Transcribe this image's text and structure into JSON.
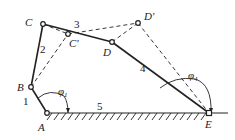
{
  "diagram": {
    "type": "five-bar linkage",
    "points": {
      "A": {
        "label": "A",
        "x": 47,
        "y": 113
      },
      "B": {
        "label": "B",
        "x": 31,
        "y": 87
      },
      "C": {
        "label": "C",
        "x": 43,
        "y": 24
      },
      "C_prime": {
        "label": "C'",
        "x": 68,
        "y": 34
      },
      "D": {
        "label": "D",
        "x": 112,
        "y": 42
      },
      "D_prime": {
        "label": "D'",
        "x": 138,
        "y": 23
      },
      "E": {
        "label": "E",
        "x": 209,
        "y": 113
      }
    },
    "links": [
      {
        "id": "1",
        "label": "1",
        "from": "A",
        "to": "B"
      },
      {
        "id": "2",
        "label": "2",
        "from": "B",
        "to": "C"
      },
      {
        "id": "3",
        "label": "3",
        "from": "C",
        "to": "D"
      },
      {
        "id": "4",
        "label": "4",
        "from": "D",
        "to": "E"
      },
      {
        "id": "5",
        "label": "5",
        "from": "A",
        "to": "E"
      }
    ],
    "angles": [
      {
        "id": "phi1",
        "symbol": "φ",
        "subscript": "1"
      },
      {
        "id": "phi4",
        "symbol": "φ",
        "subscript": "4"
      }
    ],
    "colors": {
      "line": "#222222",
      "background": "#ffffff"
    }
  }
}
